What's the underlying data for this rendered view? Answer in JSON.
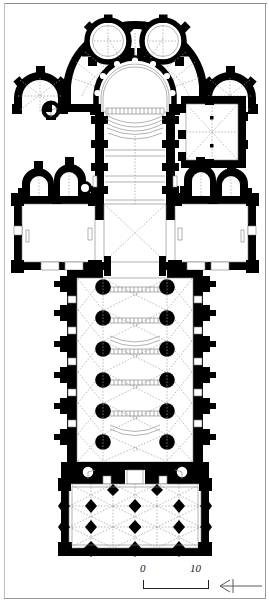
{
  "figure": {
    "type": "architectural-floor-plan",
    "orientation_note": "north arrow points left",
    "background_color": "#ffffff",
    "wall_fill_color": "#000000",
    "vault_line_color": "#9a9a9a",
    "frame_color": "#9a9a9a"
  },
  "scale_bar": {
    "start_label": "0",
    "end_label": "10",
    "unit_implied": "metres",
    "segments": 1
  },
  "north_arrow": {
    "label": "",
    "direction": "left"
  },
  "plan_parts": {
    "chevet": "apse with ambulatory and radiating chapels",
    "radiating_chapels_count": 2,
    "transept_chapels_count": 4,
    "sacristy": "rectangular vaulted chamber east of north transept",
    "stair_turret": "spiral stair at west of south transept",
    "nave_bays": 6,
    "nave_pier_rows": 2,
    "nave_piers_per_row": 6,
    "narthex_bays": "3 x 3",
    "narthex_pier_count": 12
  }
}
